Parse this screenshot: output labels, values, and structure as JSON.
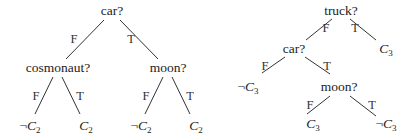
{
  "diagram": {
    "type": "decision-trees",
    "trees": [
      {
        "id": "tree-left",
        "root": {
          "label": "car?",
          "edges": [
            {
              "label": "F",
              "child": {
                "label": "cosmonaut?",
                "edges": [
                  {
                    "label": "F",
                    "leaf": {
                      "neg": "¬",
                      "var": "C",
                      "sub": "2"
                    }
                  },
                  {
                    "label": "T",
                    "leaf": {
                      "neg": "",
                      "var": "C",
                      "sub": "2"
                    }
                  }
                ]
              }
            },
            {
              "label": "T",
              "child": {
                "label": "moon?",
                "edges": [
                  {
                    "label": "F",
                    "leaf": {
                      "neg": "¬",
                      "var": "C",
                      "sub": "2"
                    }
                  },
                  {
                    "label": "T",
                    "leaf": {
                      "neg": "",
                      "var": "C",
                      "sub": "2"
                    }
                  }
                ]
              }
            }
          ]
        }
      },
      {
        "id": "tree-right",
        "root": {
          "label": "truck?",
          "edges": [
            {
              "label": "F",
              "child": {
                "label": "car?",
                "edges": [
                  {
                    "label": "F",
                    "leaf": {
                      "neg": "¬",
                      "var": "C",
                      "sub": "3"
                    }
                  },
                  {
                    "label": "T",
                    "child": {
                      "label": "moon?",
                      "edges": [
                        {
                          "label": "F",
                          "leaf": {
                            "neg": "",
                            "var": "C",
                            "sub": "3"
                          }
                        },
                        {
                          "label": "T",
                          "leaf": {
                            "neg": "¬",
                            "var": "C",
                            "sub": "3"
                          }
                        }
                      ]
                    }
                  }
                ]
              }
            },
            {
              "label": "T",
              "leaf": {
                "neg": "",
                "var": "C",
                "sub": "3"
              }
            }
          ]
        }
      }
    ]
  }
}
